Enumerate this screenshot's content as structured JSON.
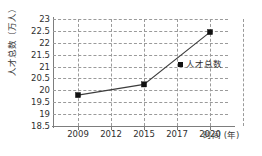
{
  "chart_data": {
    "type": "line",
    "title": "",
    "xlabel": "时间 (年)",
    "ylabel": "人才总数（万人）",
    "categories": [
      "2009",
      "2012",
      "2015",
      "2017",
      "2020"
    ],
    "x_tick_labels": [
      "2009",
      "2012",
      "2015",
      "2017",
      "2020"
    ],
    "y_tick_labels": [
      "18.5",
      "19",
      "19.5",
      "20",
      "20.5",
      "21",
      "21.5",
      "22",
      "22.5",
      "23"
    ],
    "y_tick_values": [
      18.5,
      19,
      19.5,
      20,
      20.5,
      21,
      21.5,
      22,
      22.5,
      23
    ],
    "ylim": [
      18.5,
      23
    ],
    "grid": true,
    "grid_style": "dashed",
    "grid_color": "#9a9a9a",
    "legend_position": "inside-right",
    "series": [
      {
        "name": "人才总数",
        "marker": "square",
        "color": "#111111",
        "points": [
          {
            "x": "2009",
            "y": 19.8
          },
          {
            "x": "2015",
            "y": 20.25
          },
          {
            "x": "2020",
            "y": 22.45
          }
        ],
        "values": [
          19.8,
          null,
          20.25,
          null,
          22.45
        ]
      }
    ],
    "annotations": []
  },
  "legend": {
    "entries": [
      {
        "label": "人才总数",
        "swatch_color": "#111111"
      }
    ]
  },
  "axis": {
    "y_title": "人才总数（万人）",
    "x_title": "时间 (年)"
  }
}
